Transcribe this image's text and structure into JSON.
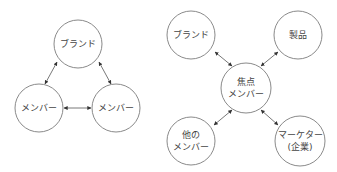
{
  "diagrams": [
    {
      "name": "triad",
      "nodes": [
        {
          "id": "brand",
          "lines": [
            "ブランド"
          ]
        },
        {
          "id": "member_left",
          "lines": [
            "メンバー"
          ]
        },
        {
          "id": "member_right",
          "lines": [
            "メンバー"
          ]
        }
      ],
      "edges": [
        {
          "from": "brand",
          "to": "member_left",
          "type": "bidirectional"
        },
        {
          "from": "brand",
          "to": "member_right",
          "type": "bidirectional"
        },
        {
          "from": "member_left",
          "to": "member_right",
          "type": "bidirectional"
        }
      ]
    },
    {
      "name": "focal-member-network",
      "nodes": [
        {
          "id": "brand",
          "lines": [
            "ブランド"
          ]
        },
        {
          "id": "product",
          "lines": [
            "製品"
          ]
        },
        {
          "id": "focal_member",
          "lines": [
            "焦点",
            "メンバー"
          ]
        },
        {
          "id": "other_members",
          "lines": [
            "他の",
            "メンバー"
          ]
        },
        {
          "id": "marketer",
          "lines": [
            "マーケター",
            "(企業)"
          ]
        }
      ],
      "edges": [
        {
          "from": "focal_member",
          "to": "brand",
          "type": "bidirectional"
        },
        {
          "from": "focal_member",
          "to": "product",
          "type": "bidirectional"
        },
        {
          "from": "focal_member",
          "to": "other_members",
          "type": "bidirectional"
        },
        {
          "from": "focal_member",
          "to": "marketer",
          "type": "bidirectional"
        }
      ]
    }
  ]
}
